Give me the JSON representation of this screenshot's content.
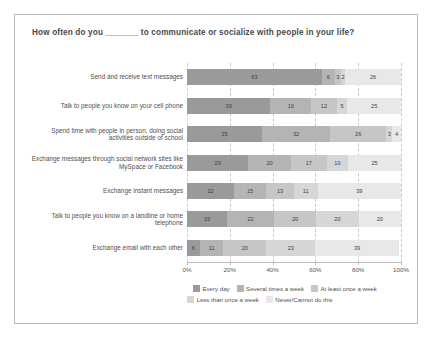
{
  "title": "How often do you _______ to communicate or socialize with people in your life?",
  "axis": {
    "tick_labels": [
      "0%",
      "20%",
      "40%",
      "60%",
      "80%",
      "100%"
    ],
    "ticks": [
      0,
      20,
      40,
      60,
      80,
      100
    ],
    "min": 0,
    "max": 100
  },
  "legend": {
    "rows": [
      [
        {
          "label": "Every day",
          "color": "#9a9a9a"
        },
        {
          "label": "Several times a week",
          "color": "#b4b4b4"
        },
        {
          "label": "At least once a week",
          "color": "#c6c6c6"
        }
      ],
      [
        {
          "label": "Less than once a week",
          "color": "#d6d6d6"
        },
        {
          "label": "Never/Cannot do this",
          "color": "#e8e8e8"
        }
      ]
    ]
  },
  "chart_data": {
    "type": "bar",
    "orientation": "horizontal",
    "stacked": true,
    "normalized_percent": true,
    "title": "How often do you _______ to communicate or socialize with people in your life?",
    "xlabel": "",
    "ylabel": "",
    "xlim": [
      0,
      100
    ],
    "grid": true,
    "legend_position": "bottom",
    "categories": [
      "Send and receive text messages",
      "Talk to people you know on your cell phone",
      "Spend time with people in person, doing social activities outside of school",
      "Exchange messages through social network sites like MySpace or Facebook",
      "Exchange instant messages",
      "Talk to people you know on a landline or home telephone",
      "Exchange email with each other"
    ],
    "series": [
      {
        "name": "Every day",
        "color": "#9a9a9a",
        "values": [
          63,
          39,
          35,
          29,
          22,
          19,
          6
        ]
      },
      {
        "name": "Several times a week",
        "color": "#b4b4b4",
        "values": [
          6,
          19,
          32,
          20,
          15,
          22,
          11
        ]
      },
      {
        "name": "At least once a week",
        "color": "#c6c6c6",
        "values": [
          3,
          12,
          26,
          17,
          13,
          20,
          20
        ]
      },
      {
        "name": "Less than once a week",
        "color": "#d6d6d6",
        "values": [
          2,
          5,
          3,
          10,
          11,
          20,
          23
        ]
      },
      {
        "name": "Never/Cannot do this",
        "color": "#e8e8e8",
        "values": [
          26,
          25,
          4,
          25,
          39,
          20,
          39
        ]
      }
    ]
  }
}
